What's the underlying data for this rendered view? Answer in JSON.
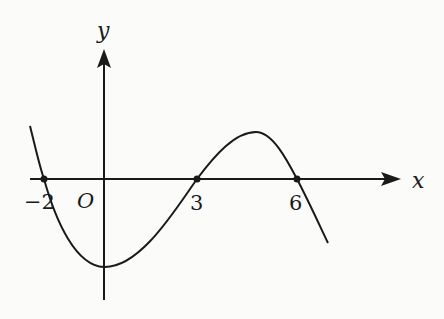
{
  "diagram": {
    "type": "function-graph",
    "axes": {
      "x_label": "x",
      "y_label": "y",
      "origin_label": "O"
    },
    "x_intercepts": [
      {
        "value": -2,
        "label": "−2"
      },
      {
        "value": 3,
        "label": "3"
      },
      {
        "value": 6,
        "label": "6"
      }
    ],
    "curve": {
      "description": "Cubic-like curve decreasing from left, crossing x-axis at -2, local minimum on y-axis below x-axis, rising through 3, local maximum between 3 and 6, falling through 6",
      "local_minimum_x": 0,
      "local_maximum_between": [
        3,
        6
      ]
    },
    "colors": {
      "ink": "#1a1a1a",
      "background": "#fbfbfa"
    }
  }
}
